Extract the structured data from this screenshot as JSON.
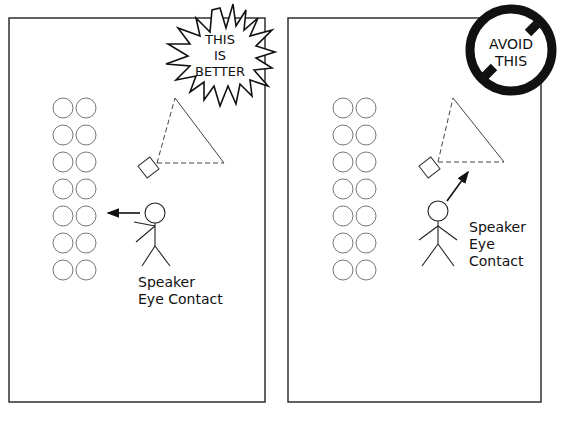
{
  "left_panel": {
    "badge": {
      "shape": "starburst",
      "lines": [
        "THIS",
        "IS",
        "BETTER"
      ]
    },
    "speaker_label": [
      "Speaker",
      "Eye Contact"
    ],
    "gaze_direction": "audience",
    "audience_rows": 7,
    "audience_cols": 2
  },
  "right_panel": {
    "badge": {
      "shape": "prohibition-sign",
      "lines": [
        "AVOID",
        "THIS"
      ]
    },
    "speaker_label": [
      "Speaker",
      "Eye",
      "Contact"
    ],
    "gaze_direction": "camera",
    "audience_rows": 7,
    "audience_cols": 2
  },
  "colors": {
    "ink": "#111111",
    "seat": "#777777",
    "background": "#ffffff"
  }
}
